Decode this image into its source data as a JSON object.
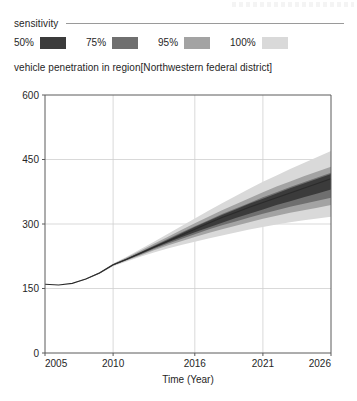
{
  "header": {
    "sensitivity_label": "sensitivity"
  },
  "legend": {
    "items": [
      {
        "label": "50%",
        "color": "#3b3b3b"
      },
      {
        "label": "75%",
        "color": "#6f6f6f"
      },
      {
        "label": "95%",
        "color": "#a3a3a3"
      },
      {
        "label": "100%",
        "color": "#d9d9d9"
      }
    ]
  },
  "chart_data": {
    "type": "area",
    "title": "vehicle penetration in region[Northwestern federal district]",
    "xlabel": "Time (Year)",
    "ylabel": "",
    "xlim": [
      2005,
      2026
    ],
    "ylim": [
      0,
      600
    ],
    "xticks": [
      2005,
      2010,
      2016,
      2021,
      2026
    ],
    "yticks": [
      0,
      150,
      300,
      450,
      600
    ],
    "grid": true,
    "legend_position": "top",
    "x": [
      2005,
      2006,
      2007,
      2008,
      2009,
      2010,
      2011,
      2012,
      2013,
      2014,
      2015,
      2016,
      2017,
      2018,
      2019,
      2020,
      2021,
      2022,
      2023,
      2024,
      2025,
      2026
    ],
    "median": [
      160,
      158,
      162,
      172,
      186,
      205,
      218,
      232,
      246,
      260,
      274,
      288,
      302,
      315,
      327,
      339,
      350,
      361,
      372,
      383,
      394,
      405
    ],
    "series": [
      {
        "name": "100%",
        "color": "#d9d9d9",
        "lower": [
          160,
          158,
          162,
          171,
          184,
          202,
          213,
          224,
          234,
          243,
          251,
          259,
          266,
          273,
          280,
          287,
          293,
          299,
          304,
          309,
          313,
          317
        ],
        "upper": [
          160,
          158,
          162,
          173,
          188,
          208,
          224,
          241,
          259,
          277,
          295,
          313,
          331,
          348,
          365,
          382,
          398,
          413,
          428,
          442,
          456,
          470
        ]
      },
      {
        "name": "95%",
        "color": "#a3a3a3",
        "lower": [
          160,
          158,
          162,
          171,
          185,
          203,
          215,
          227,
          239,
          250,
          260,
          270,
          279,
          288,
          296,
          304,
          312,
          319,
          326,
          332,
          338,
          344
        ],
        "upper": [
          160,
          158,
          162,
          173,
          187,
          207,
          222,
          238,
          254,
          270,
          286,
          302,
          317,
          332,
          346,
          360,
          374,
          387,
          399,
          411,
          422,
          433
        ]
      },
      {
        "name": "75%",
        "color": "#6f6f6f",
        "lower": [
          160,
          158,
          162,
          172,
          185,
          204,
          216,
          229,
          242,
          254,
          265,
          276,
          287,
          297,
          306,
          315,
          324,
          332,
          340,
          347,
          354,
          361
        ],
        "upper": [
          160,
          158,
          162,
          172,
          187,
          206,
          220,
          235,
          250,
          265,
          280,
          295,
          309,
          323,
          336,
          349,
          362,
          374,
          386,
          397,
          408,
          419
        ]
      },
      {
        "name": "50%",
        "color": "#3b3b3b",
        "lower": [
          160,
          158,
          162,
          172,
          186,
          204,
          217,
          230,
          244,
          257,
          269,
          281,
          292,
          303,
          314,
          324,
          334,
          344,
          353,
          362,
          371,
          380
        ],
        "upper": [
          160,
          158,
          162,
          172,
          186,
          206,
          219,
          234,
          248,
          263,
          278,
          293,
          307,
          321,
          334,
          347,
          359,
          371,
          383,
          394,
          405,
          416
        ]
      }
    ]
  },
  "plot_geometry": {
    "left": 45,
    "right": 331,
    "top": 95,
    "bottom": 353
  }
}
